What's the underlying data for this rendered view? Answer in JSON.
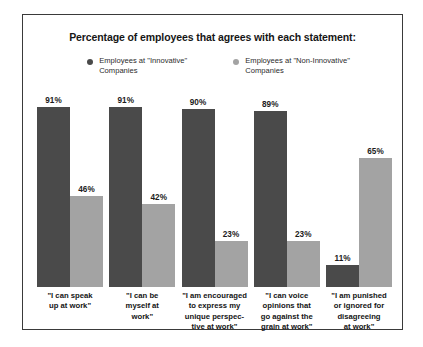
{
  "chart_data": {
    "type": "bar",
    "title": "Percentage of employees that agrees with each statement:",
    "xlabel": "",
    "ylabel": "",
    "ylim": [
      0,
      100
    ],
    "grid": false,
    "legend_position": "top-center",
    "value_suffix": "%",
    "categories": [
      "\"I can speak\nup at work\"",
      "\"I can be\nmyself at\nwork\"",
      "\"I am encouraged\nto express my\nunique perspec-\ntive at work\"",
      "\"I can voice\nopinions that\ngo against the\ngrain at work\"",
      "\"I am punished\nor ignored for\ndisagreeing\nat work\""
    ],
    "series": [
      {
        "name": "Employees at \"Innovative\"\nCompanies",
        "color": "#4a4a4a",
        "values": [
          91,
          91,
          90,
          89,
          11
        ],
        "labels": [
          "91%",
          "91%",
          "90%",
          "89%",
          "11%"
        ]
      },
      {
        "name": "Employees at \"Non-Innovative\"\nCompanies",
        "color": "#a3a3a3",
        "values": [
          46,
          42,
          23,
          23,
          65
        ],
        "labels": [
          "46%",
          "42%",
          "23%",
          "23%",
          "65%"
        ]
      }
    ]
  },
  "frame": {
    "border_color": "#3a3a3a",
    "background": "#ffffff"
  }
}
